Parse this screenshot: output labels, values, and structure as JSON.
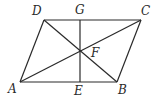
{
  "figure": {
    "type": "parallelogram with diagonals and perpendicular",
    "points": {
      "A": {
        "label": "A",
        "x": 20,
        "y": 82,
        "lx": 8,
        "ly": 93
      },
      "B": {
        "label": "B",
        "x": 117,
        "y": 82,
        "lx": 118,
        "ly": 94
      },
      "C": {
        "label": "C",
        "x": 141,
        "y": 20,
        "lx": 141,
        "ly": 15
      },
      "D": {
        "label": "D",
        "x": 44,
        "y": 20,
        "lx": 32,
        "ly": 15
      },
      "E": {
        "label": "E",
        "x": 80,
        "y": 82,
        "lx": 74,
        "ly": 95
      },
      "F": {
        "label": "F",
        "x": 80,
        "y": 51,
        "lx": 91,
        "ly": 57
      },
      "G": {
        "label": "G",
        "x": 80,
        "y": 20,
        "lx": 75,
        "ly": 14
      }
    },
    "segments": [
      [
        "A",
        "B"
      ],
      [
        "B",
        "C"
      ],
      [
        "C",
        "D"
      ],
      [
        "D",
        "A"
      ],
      [
        "A",
        "C"
      ],
      [
        "D",
        "B"
      ],
      [
        "G",
        "E"
      ]
    ],
    "line_color": "#2a2a2a"
  }
}
